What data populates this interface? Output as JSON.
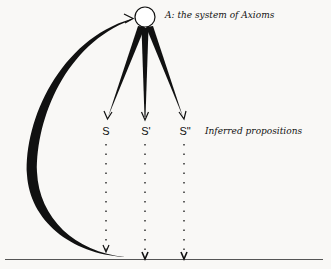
{
  "diagram": {
    "axioms_label": "A: the system of Axioms",
    "inferred_label": "Inferred propositions",
    "propositions": [
      {
        "label": "S"
      },
      {
        "label": "S'"
      },
      {
        "label": "S\""
      }
    ],
    "colors": {
      "background": "#f9f8f6",
      "ink": "#111111",
      "baseline": "#555555"
    }
  }
}
